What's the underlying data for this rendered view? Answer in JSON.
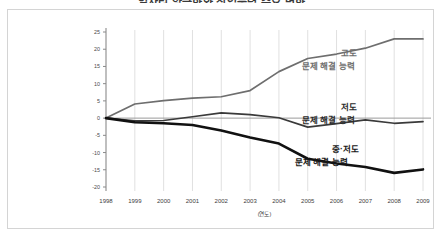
{
  "title": "일자리 양극화와 직업능력 수요 변화",
  "axis_title_label": "(연도)",
  "colors": {
    "high_series": "#6e6e6e",
    "low_series": "#3a3a3a",
    "mid_low_series": "#111111",
    "zero_line": "#9a9a9a",
    "gridline": "#d8d8d8",
    "axis": "#8a8a8a",
    "frame": "#d4d4d4",
    "background": "#ffffff"
  },
  "labels": {
    "high_line1": "고도",
    "high_line2": "문제 해결 능력",
    "low_line1": "저도",
    "low_line2": "문제 해결 능력",
    "midlow_line1": "중·저도",
    "midlow_line2": "문제 해결 능력"
  },
  "chart_data": {
    "type": "line",
    "title": "일자리 양극화와 직업능력 수요 변화",
    "xlabel": "(연도)",
    "ylabel": "",
    "x": [
      1998,
      1999,
      2000,
      2001,
      2002,
      2003,
      2004,
      2005,
      2006,
      2007,
      2008,
      2009
    ],
    "categories": [
      "1998",
      "1999",
      "2000",
      "2001",
      "2002",
      "2003",
      "2004",
      "2005",
      "2006",
      "2007",
      "2008",
      "2009"
    ],
    "xlim": [
      1998,
      2009
    ],
    "ylim": [
      -20,
      25
    ],
    "yticks": [
      25,
      20,
      15,
      10,
      5,
      0,
      -5,
      -10,
      -15,
      -20
    ],
    "ytick_labels": [
      "25",
      "20",
      "15",
      "10",
      "5",
      "0",
      "-5",
      "-10",
      "-15",
      "-20"
    ],
    "grid": true,
    "grid_axis": "x",
    "legend": "inline-right-annotations",
    "series": [
      {
        "name": "고도 문제 해결 능력",
        "values": [
          0,
          4.1,
          5.1,
          5.8,
          6.2,
          8.0,
          13.5,
          17.3,
          18.6,
          20.3,
          23.0,
          23.0
        ]
      },
      {
        "name": "저도 문제 해결 능력",
        "values": [
          0,
          -0.8,
          -0.7,
          0.4,
          1.5,
          1.0,
          0.1,
          -2.6,
          -1.6,
          -0.5,
          -1.5,
          -1.0
        ]
      },
      {
        "name": "중·저도 문제 해결 능력",
        "values": [
          0,
          -1.2,
          -1.5,
          -2.0,
          -3.6,
          -5.6,
          -7.4,
          -11.8,
          -13.2,
          -14.2,
          -15.9,
          -14.9
        ]
      }
    ]
  }
}
